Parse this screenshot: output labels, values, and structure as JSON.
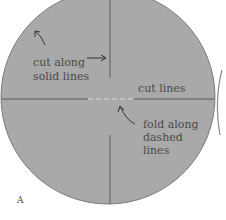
{
  "diagram": {
    "figure_letter": "A",
    "labels": {
      "cut_along_line1": "cut along",
      "cut_along_line2": "solid lines",
      "cut_lines": "cut lines",
      "fold_line1": "fold along",
      "fold_line2": "dashed",
      "fold_line3": "lines"
    },
    "colors": {
      "circle_fill": "#a9a9a9",
      "circle_edge": "#7a7a7a",
      "line": "#5a5a5a",
      "text": "#4a4a4a",
      "background": "#ffffff"
    }
  }
}
